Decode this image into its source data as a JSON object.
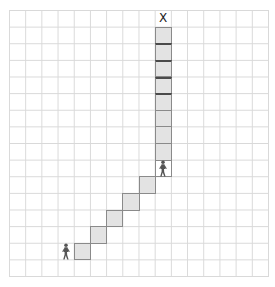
{
  "diagram": {
    "type": "grid-path",
    "grid": {
      "columns": 16,
      "rows": 16
    },
    "goal": {
      "label": "X",
      "col": 9,
      "row": 0
    },
    "path_cells": [
      {
        "col": 9,
        "row": 1,
        "dark_top": false
      },
      {
        "col": 9,
        "row": 2,
        "dark_top": true
      },
      {
        "col": 9,
        "row": 3,
        "dark_top": true
      },
      {
        "col": 9,
        "row": 4,
        "dark_top": true
      },
      {
        "col": 9,
        "row": 5,
        "dark_top": true
      },
      {
        "col": 9,
        "row": 6,
        "dark_top": false
      },
      {
        "col": 9,
        "row": 7,
        "dark_top": false
      },
      {
        "col": 9,
        "row": 8,
        "dark_top": false
      },
      {
        "col": 8,
        "row": 10,
        "dark_top": false
      },
      {
        "col": 7,
        "row": 11,
        "dark_top": false
      },
      {
        "col": 6,
        "row": 12,
        "dark_top": false
      },
      {
        "col": 5,
        "row": 13,
        "dark_top": false
      },
      {
        "col": 4,
        "row": 14,
        "dark_top": false
      }
    ],
    "figures": [
      {
        "name": "walker-mid",
        "col": 9,
        "row": 9,
        "boxed": true
      },
      {
        "name": "walker-start",
        "col": 3,
        "row": 14,
        "boxed": false
      }
    ],
    "colors": {
      "grid_line": "#d9d9d9",
      "path_fill": "#e3e3e3",
      "path_border": "#8a8a8a",
      "figure": "#555555"
    }
  }
}
